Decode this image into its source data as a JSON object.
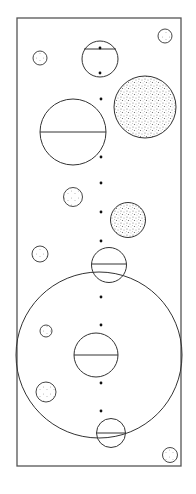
{
  "diagram": {
    "type": "abstract-circles-figure",
    "colors": {
      "stroke": "#333333",
      "frame": "#555555",
      "stipple": "#777777",
      "background": "#ffffff"
    },
    "element_counts": {
      "plain_circles": 1,
      "stippled_circles": 7,
      "chord_circles": 5,
      "dots": 10
    }
  }
}
